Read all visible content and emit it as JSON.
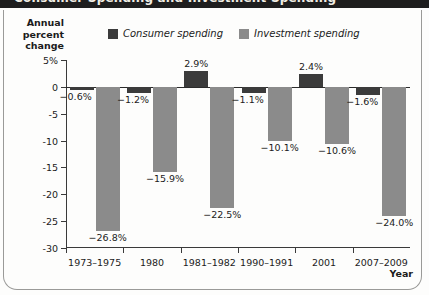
{
  "figure": {
    "top_band_title": "Consumer Spending and Investment Spending",
    "y_axis_title": "Annual\npercent\nchange",
    "x_axis_title": "Year"
  },
  "legend": {
    "position": "top-center",
    "items": [
      {
        "label": "Consumer spending",
        "color": "#3b3b3b",
        "icon": "legend-swatch-icon"
      },
      {
        "label": "Investment spending",
        "color": "#8b8b8b",
        "icon": "legend-swatch-icon"
      }
    ]
  },
  "chart_data": {
    "type": "bar",
    "title": "Consumer Spending and Investment Spending",
    "xlabel": "Year",
    "ylabel": "Annual percent change",
    "ylim": [
      -30,
      5
    ],
    "grid": false,
    "legend_position": "top-center",
    "categories": [
      "1973–1975",
      "1980",
      "1981–1982",
      "1990–1991",
      "2001",
      "2007–2009"
    ],
    "ytick_labels": [
      "5%",
      "0",
      "-5",
      "-10",
      "-15",
      "-20",
      "-25",
      "-30"
    ],
    "ytick_values": [
      5,
      0,
      -5,
      -10,
      -15,
      -20,
      -25,
      -30
    ],
    "series": [
      {
        "name": "Consumer spending",
        "color": "#3b3b3b",
        "values": [
          -0.6,
          -1.2,
          2.9,
          -1.1,
          2.4,
          -1.6
        ],
        "labels": [
          "−0.6%",
          "−1.2%",
          "2.9%",
          "−1.1%",
          "2.4%",
          "−1.6%"
        ]
      },
      {
        "name": "Investment spending",
        "color": "#8b8b8b",
        "values": [
          -26.8,
          -15.9,
          -22.5,
          -10.1,
          -10.6,
          -24.0
        ],
        "labels": [
          "−26.8%",
          "−15.9%",
          "−22.5%",
          "−10.1%",
          "−10.6%",
          "−24.0%"
        ]
      }
    ]
  }
}
